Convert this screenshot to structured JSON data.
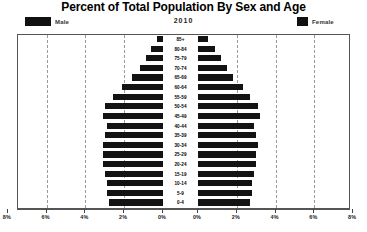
{
  "title": "Percent of Total Population By Sex and Age",
  "year": "2010",
  "legend": {
    "male": "Male",
    "female": "Female",
    "swatch_color": "#131313"
  },
  "axis": {
    "tick_labels_left": [
      "8%",
      "6%",
      "4%",
      "2%",
      "0%"
    ],
    "tick_labels_right": [
      "0%",
      "2%",
      "4%",
      "6%",
      "8%"
    ]
  },
  "chart_data": {
    "type": "bar",
    "subtype": "population-pyramid",
    "title": "Percent of Total Population By Sex and Age",
    "subtitle": "2010",
    "xlabel": "",
    "ylabel": "",
    "xlim": [
      0,
      8
    ],
    "xunit": "%",
    "grid": true,
    "legend_position": "top",
    "categories": [
      "85+",
      "80-84",
      "75-79",
      "70-74",
      "65-69",
      "60-64",
      "55-59",
      "50-54",
      "45-49",
      "40-44",
      "35-39",
      "30-34",
      "25-29",
      "20-24",
      "15-19",
      "10-14",
      "5-9",
      "0-4"
    ],
    "series": [
      {
        "name": "Male",
        "side": "left",
        "values": [
          0.3,
          0.6,
          0.9,
          1.2,
          1.6,
          2.1,
          2.6,
          3.0,
          3.1,
          2.9,
          3.0,
          3.1,
          3.1,
          3.1,
          3.0,
          2.9,
          2.9,
          2.8
        ]
      },
      {
        "name": "Female",
        "side": "right",
        "values": [
          0.5,
          0.9,
          1.2,
          1.5,
          1.8,
          2.3,
          2.7,
          3.1,
          3.2,
          2.9,
          3.0,
          3.1,
          3.0,
          3.0,
          2.9,
          2.8,
          2.8,
          2.7
        ]
      }
    ]
  }
}
